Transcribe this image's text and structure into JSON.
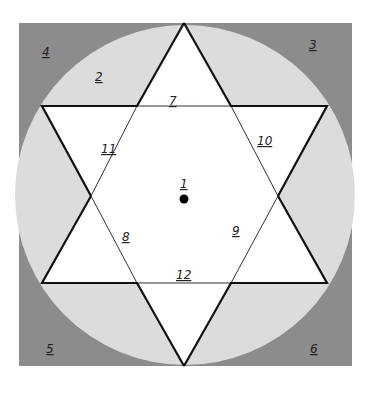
{
  "diagram": {
    "type": "star-of-david-in-circle-in-square",
    "colors": {
      "square": "#8c8c8c",
      "circle": "#dcdcdc",
      "star": "#ffffff",
      "lines": "#111111",
      "dot": "#000000"
    },
    "geometry": {
      "square": {
        "x": 19,
        "y": 23,
        "w": 333,
        "h": 343
      },
      "circle": {
        "cx": 185,
        "cy": 195,
        "r": 170
      },
      "up_triangle": [
        [
          184,
          23
        ],
        [
          42,
          283
        ],
        [
          327,
          283
        ]
      ],
      "down_triangle": [
        [
          184,
          366
        ],
        [
          42,
          106
        ],
        [
          327,
          106
        ]
      ]
    },
    "labels": [
      {
        "id": "1",
        "text": "1",
        "x": 182,
        "y": 186
      },
      {
        "id": "2",
        "text": "2",
        "x": 98,
        "y": 80
      },
      {
        "id": "3",
        "text": "3",
        "x": 312,
        "y": 49
      },
      {
        "id": "4",
        "text": "4",
        "x": 44,
        "y": 55
      },
      {
        "id": "5",
        "text": "5",
        "x": 48,
        "y": 352
      },
      {
        "id": "6",
        "text": "6",
        "x": 312,
        "y": 352
      },
      {
        "id": "7",
        "text": "7",
        "x": 172,
        "y": 104
      },
      {
        "id": "8",
        "text": "8",
        "x": 125,
        "y": 240
      },
      {
        "id": "9",
        "text": "9",
        "x": 234,
        "y": 234
      },
      {
        "id": "10",
        "text": "10",
        "x": 260,
        "y": 144
      },
      {
        "id": "11",
        "text": "11",
        "x": 104,
        "y": 152
      },
      {
        "id": "12",
        "text": "12",
        "x": 180,
        "y": 278
      }
    ]
  }
}
